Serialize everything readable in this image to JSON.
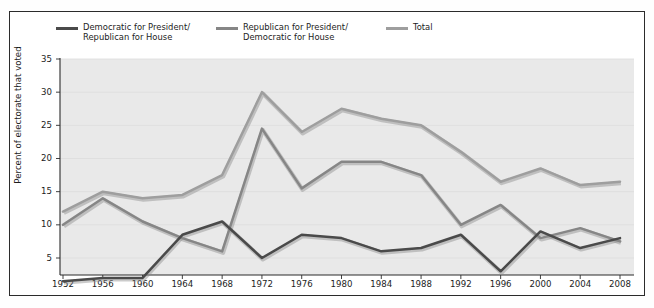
{
  "chart_data": {
    "type": "line",
    "title": "",
    "subtitle": "",
    "xlabel": "",
    "ylabel": "Percent of electorate that voted",
    "categories": [
      1952,
      1956,
      1960,
      1964,
      1968,
      1972,
      1976,
      1980,
      1984,
      1988,
      1992,
      1996,
      2000,
      2004,
      2008
    ],
    "xtick_labels": [
      "1952",
      "1956",
      "1960",
      "1964",
      "1968",
      "1972",
      "1976",
      "1980",
      "1984",
      "1988",
      "1992",
      "1996",
      "2000",
      "2004",
      "2008"
    ],
    "ytick_labels": [
      "5",
      "10",
      "15",
      "20",
      "25",
      "30",
      "35"
    ],
    "ytick_values": [
      5,
      10,
      15,
      20,
      25,
      30,
      35
    ],
    "ylim": [
      0,
      35
    ],
    "xlim": [
      1952,
      2008
    ],
    "grid": true,
    "grid_axis": "y",
    "legend_position": "top",
    "plot_background": "#e9e9e9",
    "series": [
      {
        "name": "Democratic for President/\nRepublican for House",
        "color": "#4a4a4a",
        "values": [
          1.5,
          2.0,
          2.0,
          8.5,
          10.5,
          5.0,
          8.5,
          8.0,
          6.0,
          6.5,
          8.5,
          3.0,
          9.0,
          6.5,
          8.0
        ]
      },
      {
        "name": "Republican for President/\nDemocratic for House",
        "color": "#868686",
        "values": [
          10.0,
          14.0,
          10.5,
          8.0,
          6.0,
          24.5,
          15.5,
          19.5,
          19.5,
          17.5,
          10.0,
          13.0,
          8.0,
          9.5,
          7.5
        ]
      },
      {
        "name": "Total",
        "color": "#9e9e9e",
        "values": [
          12.0,
          15.0,
          14.0,
          14.5,
          17.5,
          30.0,
          24.0,
          27.5,
          26.0,
          25.0,
          21.0,
          16.5,
          18.5,
          16.0,
          16.5
        ]
      }
    ]
  },
  "legend": {
    "items": [
      {
        "label": "Democratic for President/\nRepublican for House",
        "color": "#4a4a4a"
      },
      {
        "label": "Republican for President/\nDemocratic for House",
        "color": "#868686"
      },
      {
        "label": "Total",
        "color": "#9e9e9e"
      }
    ]
  },
  "axis": {
    "y_label": "Percent of electorate that voted",
    "y_ticks": [
      "35",
      "30",
      "25",
      "20",
      "15",
      "10",
      "5"
    ],
    "x_ticks": [
      "1952",
      "1956",
      "1960",
      "1964",
      "1968",
      "1972",
      "1976",
      "1980",
      "1984",
      "1988",
      "1992",
      "1996",
      "2000",
      "2004",
      "2008"
    ]
  }
}
